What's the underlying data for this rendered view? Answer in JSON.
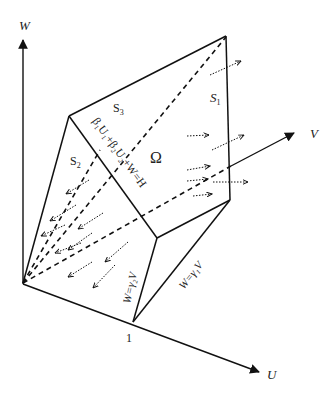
{
  "diagram": {
    "axes": {
      "w_label": "W",
      "v_label": "V",
      "u_label": "U",
      "unit_tick_label": "1"
    },
    "regions": {
      "s1_label": "S",
      "s1_sub": "1",
      "s2_label": "S",
      "s2_sub": "2",
      "s3_label": "S",
      "s3_sub": "3",
      "omega_label": "Ω"
    },
    "planes": {
      "top_plane_equation": "β₁U₁+β₂U₂+W=H",
      "gamma2_plane": "W=γ₂V",
      "gamma1_plane": "W=γ₁V"
    },
    "colors": {
      "line": "#111111",
      "text": "#222222",
      "background": "#ffffff"
    }
  }
}
